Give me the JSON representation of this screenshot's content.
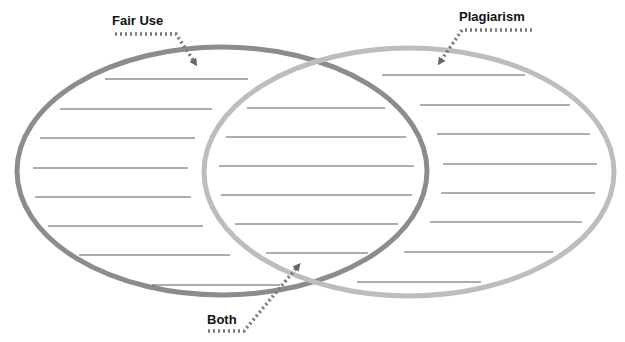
{
  "diagram": {
    "type": "venn",
    "labels": {
      "left": "Fair Use",
      "right": "Plagiarism",
      "center": "Both"
    },
    "colors": {
      "left_ring": "#8c8c8c",
      "right_ring": "#bdbdbd",
      "lines": "#5a5a5a",
      "arrow": "#666666",
      "label": "#111111"
    },
    "writing_lines": {
      "left": [
        {
          "x1": 105,
          "x2": 248,
          "y": 79
        },
        {
          "x1": 60,
          "x2": 212,
          "y": 109
        },
        {
          "x1": 40,
          "x2": 195,
          "y": 138
        },
        {
          "x1": 33,
          "x2": 188,
          "y": 168
        },
        {
          "x1": 35,
          "x2": 191,
          "y": 197
        },
        {
          "x1": 48,
          "x2": 203,
          "y": 226
        },
        {
          "x1": 79,
          "x2": 230,
          "y": 255
        },
        {
          "x1": 152,
          "x2": 280,
          "y": 285
        }
      ],
      "center": [
        {
          "x1": 247,
          "x2": 385,
          "y": 108
        },
        {
          "x1": 226,
          "x2": 406,
          "y": 137
        },
        {
          "x1": 219,
          "x2": 414,
          "y": 166
        },
        {
          "x1": 221,
          "x2": 412,
          "y": 195
        },
        {
          "x1": 235,
          "x2": 398,
          "y": 224
        },
        {
          "x1": 266,
          "x2": 368,
          "y": 253
        }
      ],
      "right": [
        {
          "x1": 382,
          "x2": 525,
          "y": 75
        },
        {
          "x1": 420,
          "x2": 570,
          "y": 105
        },
        {
          "x1": 437,
          "x2": 590,
          "y": 134
        },
        {
          "x1": 443,
          "x2": 597,
          "y": 164
        },
        {
          "x1": 441,
          "x2": 595,
          "y": 193
        },
        {
          "x1": 430,
          "x2": 582,
          "y": 222
        },
        {
          "x1": 404,
          "x2": 553,
          "y": 252
        },
        {
          "x1": 357,
          "x2": 481,
          "y": 282
        }
      ]
    }
  }
}
